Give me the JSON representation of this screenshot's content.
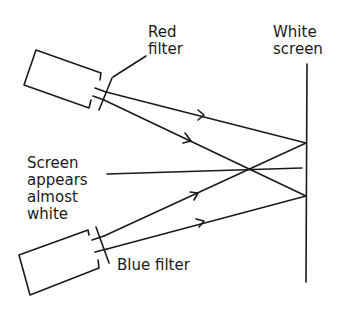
{
  "diagram": {
    "labels": {
      "red_filter": "Red\nfilter",
      "white_screen": "White\nscreen",
      "screen_appears": "Screen\nappears\nalmost\nwhite",
      "blue_filter": "Blue filter"
    },
    "components": [
      {
        "name": "Top projector",
        "filter": "Red filter"
      },
      {
        "name": "Bottom projector",
        "filter": "Blue filter"
      },
      {
        "name": "White screen"
      }
    ],
    "rays": [
      {
        "from": "Red filter projector",
        "to": "screen upper point",
        "arrow": true
      },
      {
        "from": "Red filter projector",
        "to": "screen lower point",
        "arrow": true
      },
      {
        "from": "Blue filter projector",
        "to": "screen upper point",
        "arrow": true
      },
      {
        "from": "Blue filter projector",
        "to": "screen lower point",
        "arrow": true
      }
    ],
    "colors": {
      "ink": "#1a1a1a",
      "background": "#ffffff"
    }
  }
}
